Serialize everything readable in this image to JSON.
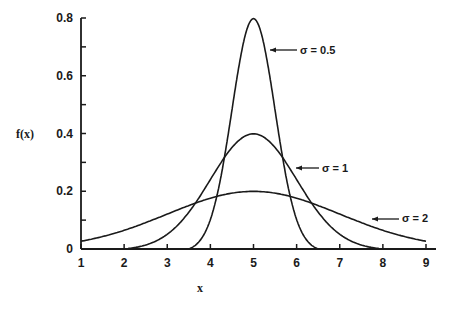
{
  "chart_data": {
    "type": "line",
    "title": "",
    "xlabel": "x",
    "ylabel": "f(x)",
    "xlim": [
      1,
      9
    ],
    "ylim": [
      0,
      0.8
    ],
    "x_ticks": [
      1,
      2,
      3,
      4,
      5,
      6,
      7,
      8,
      9
    ],
    "x_tick_labels": [
      "1",
      "2",
      "3",
      "4",
      "5",
      "6",
      "7",
      "8",
      "9"
    ],
    "y_ticks": [
      0,
      0.1,
      0.2,
      0.3,
      0.4,
      0.5,
      0.6,
      0.7,
      0.8
    ],
    "y_tick_labels": [
      "0",
      "",
      "0.2",
      "",
      "0.4",
      "",
      "0.6",
      "",
      "0.8"
    ],
    "grid": false,
    "legend": "inline annotations with arrows",
    "series": [
      {
        "name": "σ = 0.5",
        "label": "σ = 0.5",
        "mean": 5,
        "sigma": 0.5,
        "peak": 0.8,
        "x": [
          3.5,
          4.0,
          4.5,
          5.0,
          5.5,
          6.0,
          6.5
        ],
        "y": [
          0.0,
          0.108,
          0.484,
          0.798,
          0.484,
          0.108,
          0.0
        ]
      },
      {
        "name": "σ = 1",
        "label": "σ = 1",
        "mean": 5,
        "sigma": 1,
        "peak": 0.4,
        "x": [
          2.0,
          3.0,
          4.0,
          5.0,
          6.0,
          7.0,
          8.0
        ],
        "y": [
          0.0,
          0.054,
          0.242,
          0.399,
          0.242,
          0.054,
          0.0
        ]
      },
      {
        "name": "σ = 2",
        "label": "σ = 2",
        "mean": 5,
        "sigma": 2,
        "peak": 0.2,
        "x": [
          1,
          2,
          3,
          4,
          5,
          6,
          7,
          8,
          9
        ],
        "y": [
          0.027,
          0.065,
          0.121,
          0.176,
          0.199,
          0.176,
          0.121,
          0.065,
          0.027
        ]
      }
    ],
    "annotations": [
      {
        "text": "σ = 0.5",
        "points_to": "σ = 0.5 curve right flank near x≈5.3"
      },
      {
        "text": "σ = 1",
        "points_to": "σ = 1 curve right flank near x≈5.8"
      },
      {
        "text": "σ = 2",
        "points_to": "σ = 2 curve near x≈7.8"
      }
    ]
  }
}
